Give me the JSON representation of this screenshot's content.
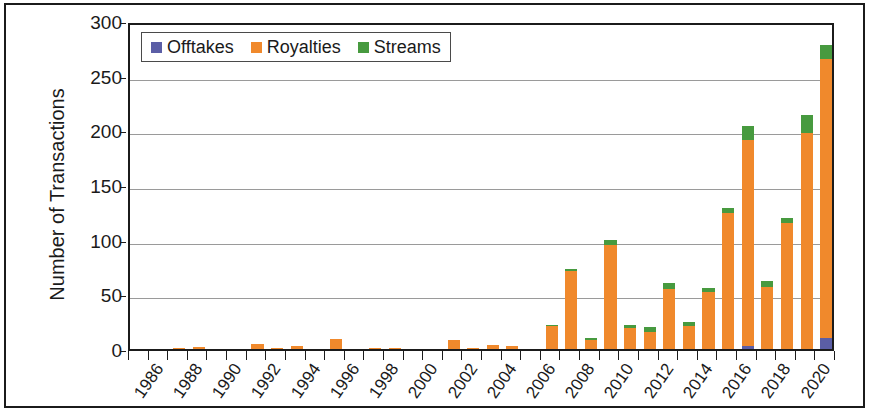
{
  "chart_data": {
    "type": "bar",
    "subtype": "stacked-bar",
    "title": "",
    "xlabel": "",
    "ylabel": "Number of Transactions",
    "ylim": [
      0,
      300
    ],
    "ytick_step": 50,
    "yticks": [
      "0",
      "50",
      "100",
      "150",
      "200",
      "250",
      "300"
    ],
    "grid": true,
    "legend_position": "top-left-inside",
    "categories": [
      "1986",
      "1987",
      "1988",
      "1989",
      "1990",
      "1991",
      "1992",
      "1993",
      "1994",
      "1995",
      "1996",
      "1997",
      "1998",
      "1999",
      "2000",
      "2001",
      "2002",
      "2003",
      "2004",
      "2005",
      "2006",
      "2007",
      "2008",
      "2009",
      "2010",
      "2011",
      "2012",
      "2013",
      "2014",
      "2015",
      "2016",
      "2017",
      "2018",
      "2019",
      "2020",
      "2021"
    ],
    "xtick_labels": [
      "1986",
      "1988",
      "1990",
      "1992",
      "1994",
      "1996",
      "1998",
      "2000",
      "2002",
      "2004",
      "2006",
      "2008",
      "2010",
      "2012",
      "2014",
      "2016",
      "2018",
      "2020"
    ],
    "series": [
      {
        "name": "Offtakes",
        "color": "#5b5ea6",
        "values": [
          0,
          0,
          0,
          0,
          0,
          0,
          0,
          0,
          0,
          0,
          0,
          0,
          0,
          0,
          0,
          0,
          0,
          0,
          0,
          0,
          0,
          0,
          0,
          0,
          0,
          0,
          0,
          0,
          0,
          0,
          0,
          3,
          0,
          0,
          0,
          10
        ]
      },
      {
        "name": "Royalties",
        "color": "#f0892c",
        "values": [
          0,
          0,
          1,
          2,
          0,
          0,
          5,
          1,
          3,
          0,
          9,
          0,
          1,
          1,
          0,
          0,
          8,
          1,
          4,
          3,
          0,
          21,
          71,
          8,
          95,
          19,
          16,
          55,
          21,
          52,
          124,
          188,
          57,
          115,
          198,
          255
        ]
      },
      {
        "name": "Streams",
        "color": "#479a3f",
        "values": [
          0,
          0,
          0,
          0,
          0,
          0,
          0,
          0,
          0,
          0,
          0,
          0,
          0,
          0,
          0,
          0,
          0,
          0,
          0,
          0,
          0,
          1,
          2,
          2,
          5,
          3,
          4,
          5,
          4,
          4,
          5,
          13,
          5,
          5,
          16,
          13
        ]
      }
    ]
  },
  "legend": {
    "items": [
      {
        "label": "Offtakes",
        "color": "#5b5ea6"
      },
      {
        "label": "Royalties",
        "color": "#f0892c"
      },
      {
        "label": "Streams",
        "color": "#479a3f"
      }
    ]
  },
  "axes": {
    "y_title": "Number of Transactions"
  }
}
